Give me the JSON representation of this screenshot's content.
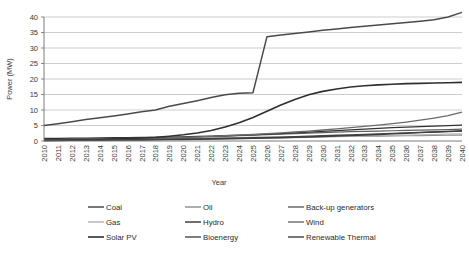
{
  "chart_data": {
    "type": "line",
    "title": "",
    "xlabel": "Year",
    "ylabel": "Power (MW)",
    "ylim": [
      0,
      40
    ],
    "yticks": [
      0,
      5,
      10,
      15,
      20,
      25,
      30,
      35,
      40
    ],
    "grid": true,
    "legend_position": "bottom",
    "x": [
      2010,
      2011,
      2012,
      2013,
      2014,
      2015,
      2016,
      2017,
      2018,
      2019,
      2020,
      2021,
      2022,
      2023,
      2024,
      2025,
      2026,
      2027,
      2028,
      2029,
      2030,
      2031,
      2032,
      2033,
      2034,
      2035,
      2036,
      2037,
      2038,
      2039,
      2040
    ],
    "categories": [
      "2010",
      "2011",
      "2012",
      "2013",
      "2014",
      "2015",
      "2016",
      "2017",
      "2018",
      "2019",
      "2020",
      "2021",
      "2022",
      "2023",
      "2024",
      "2025",
      "2026",
      "2027",
      "2028",
      "2029",
      "2030",
      "2031",
      "2032",
      "2033",
      "2034",
      "2035",
      "2036",
      "2037",
      "2038",
      "2039",
      "2040"
    ],
    "series": [
      {
        "name": "Coal",
        "color": "#4a4a4a",
        "width": 1.5,
        "values": [
          5.0,
          5.6,
          6.2,
          6.9,
          7.5,
          8.1,
          8.7,
          9.4,
          10.0,
          11.2,
          12.1,
          13.0,
          14.0,
          14.9,
          15.4,
          15.6,
          33.6,
          34.2,
          34.7,
          35.2,
          35.7,
          36.1,
          36.6,
          37.0,
          37.4,
          37.8,
          38.2,
          38.6,
          39.1,
          40.0,
          41.5
        ]
      },
      {
        "name": "Oil",
        "color": "#8c8c8c",
        "width": 1.2,
        "values": [
          0.55,
          0.6,
          0.62,
          0.65,
          0.68,
          0.7,
          0.74,
          0.78,
          0.82,
          0.86,
          0.9,
          0.95,
          1.0,
          1.05,
          1.1,
          1.15,
          1.2,
          1.25,
          1.3,
          1.35,
          1.4,
          1.45,
          1.5,
          1.55,
          1.6,
          1.65,
          1.7,
          1.75,
          1.8,
          1.85,
          1.9
        ]
      },
      {
        "name": "Back-up generators",
        "color": "#5f5f5f",
        "width": 1.2,
        "values": [
          0.5,
          0.55,
          0.6,
          0.65,
          0.7,
          0.78,
          0.85,
          0.92,
          1.0,
          1.1,
          1.2,
          1.3,
          1.45,
          1.6,
          1.75,
          1.9,
          2.05,
          2.2,
          2.4,
          2.55,
          2.7,
          2.85,
          3.0,
          3.1,
          3.2,
          3.3,
          3.4,
          3.5,
          3.6,
          3.7,
          3.8
        ]
      },
      {
        "name": "Gas",
        "color": "#b0b0b0",
        "width": 1.2,
        "values": [
          0.3,
          0.32,
          0.34,
          0.36,
          0.38,
          0.4,
          0.42,
          0.45,
          0.48,
          0.5,
          0.55,
          0.6,
          0.65,
          0.7,
          0.78,
          0.85,
          0.92,
          1.0,
          1.1,
          1.2,
          1.3,
          1.4,
          1.5,
          1.6,
          1.7,
          1.8,
          1.9,
          2.0,
          2.1,
          2.2,
          2.3
        ]
      },
      {
        "name": "Hydro",
        "color": "#333333",
        "width": 1.3,
        "values": [
          0.8,
          0.85,
          0.9,
          0.95,
          1.0,
          1.05,
          1.1,
          1.15,
          1.2,
          1.28,
          1.35,
          1.45,
          1.55,
          1.7,
          1.85,
          2.0,
          2.2,
          2.4,
          2.6,
          2.85,
          3.1,
          3.35,
          3.6,
          3.85,
          4.1,
          4.3,
          4.5,
          4.65,
          4.8,
          4.95,
          5.1
        ]
      },
      {
        "name": "Wind",
        "color": "#6b6b6b",
        "width": 1.3,
        "values": [
          0.4,
          0.45,
          0.5,
          0.55,
          0.6,
          0.68,
          0.75,
          0.85,
          0.95,
          1.05,
          1.2,
          1.35,
          1.5,
          1.7,
          1.9,
          2.1,
          2.35,
          2.6,
          2.9,
          3.2,
          3.55,
          3.9,
          4.3,
          4.7,
          5.1,
          5.6,
          6.1,
          6.7,
          7.4,
          8.2,
          9.3
        ]
      },
      {
        "name": "Solar PV",
        "color": "#2f2f2f",
        "width": 1.6,
        "values": [
          0.2,
          0.25,
          0.3,
          0.38,
          0.48,
          0.6,
          0.75,
          0.95,
          1.2,
          1.55,
          2.0,
          2.6,
          3.4,
          4.5,
          5.9,
          7.6,
          9.6,
          11.6,
          13.4,
          14.9,
          16.0,
          16.8,
          17.4,
          17.8,
          18.1,
          18.3,
          18.5,
          18.6,
          18.7,
          18.8,
          18.9
        ]
      },
      {
        "name": "Bioenergy",
        "color": "#454545",
        "width": 1.3,
        "values": [
          0.25,
          0.28,
          0.3,
          0.33,
          0.36,
          0.4,
          0.44,
          0.48,
          0.52,
          0.58,
          0.64,
          0.7,
          0.78,
          0.86,
          0.95,
          1.05,
          1.15,
          1.28,
          1.4,
          1.55,
          1.7,
          1.85,
          2.0,
          2.15,
          2.3,
          2.45,
          2.6,
          2.75,
          2.9,
          3.05,
          3.2
        ]
      },
      {
        "name": "Renewable Thermal",
        "color": "#3d3d3d",
        "width": 1.4,
        "values": [
          0.15,
          0.17,
          0.19,
          0.21,
          0.24,
          0.27,
          0.3,
          0.34,
          0.38,
          0.43,
          0.48,
          0.54,
          0.6,
          0.68,
          0.76,
          0.85,
          0.95,
          1.05,
          1.18,
          1.3,
          1.45,
          1.6,
          1.75,
          1.92,
          2.1,
          2.3,
          2.5,
          2.7,
          2.9,
          3.1,
          3.3
        ]
      }
    ]
  },
  "legend": {
    "rows": [
      [
        {
          "label": "Coal",
          "series": 0
        },
        {
          "label": "Oil",
          "series": 1
        },
        {
          "label": "Back-up generators",
          "series": 2
        }
      ],
      [
        {
          "label": "Gas",
          "series": 3
        },
        {
          "label": "Hydro",
          "series": 4
        },
        {
          "label": "Wind",
          "series": 5
        }
      ],
      [
        {
          "label": "Solar PV",
          "series": 6
        },
        {
          "label": "Bioenergy",
          "series": 7
        },
        {
          "label": "Renewable Thermal",
          "series": 8
        }
      ]
    ]
  },
  "colors": {
    "gridline": "#b8b8b8",
    "axis": "#6d6d6d",
    "text": "#2b2b2b",
    "background": "#ffffff"
  }
}
